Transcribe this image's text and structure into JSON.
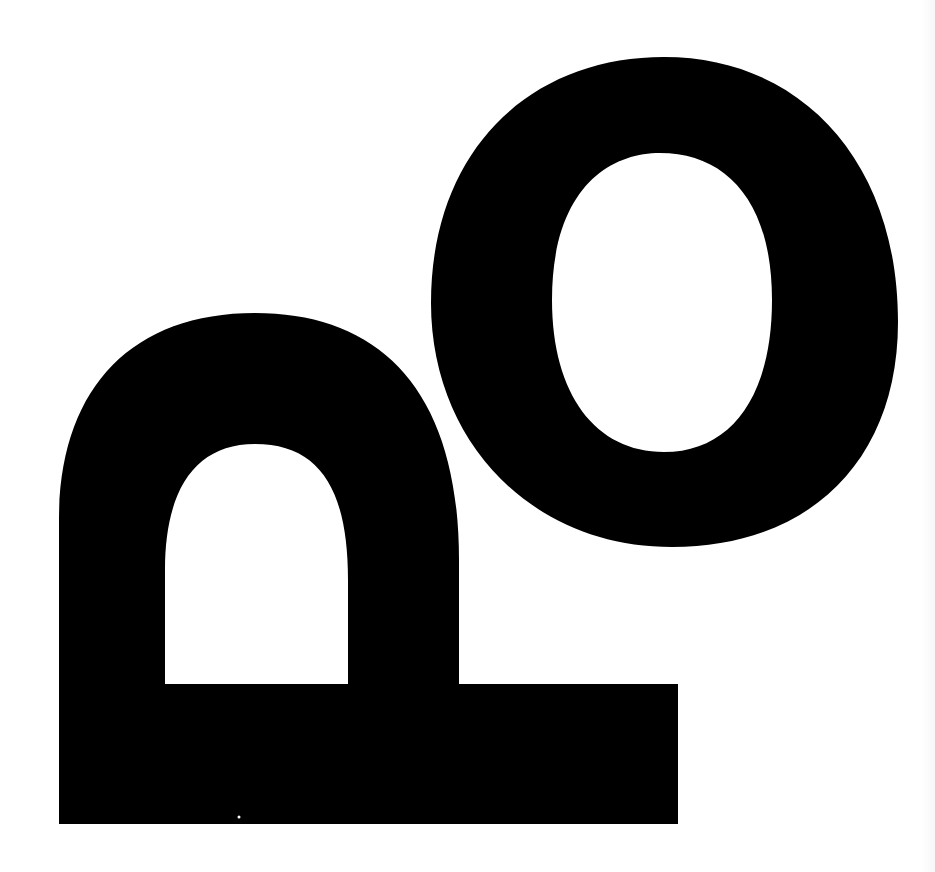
{
  "graphic": {
    "title": "pO",
    "description": "Bold black logo mark: an inverted P / arch-with-baseline shape at lower left and a large oval O at upper right",
    "colors": {
      "background": "#ffffff",
      "foreground": "#000000"
    },
    "shapes": [
      {
        "name": "arch-glyph",
        "kind": "inverted-p"
      },
      {
        "name": "o-glyph",
        "kind": "oval-ring"
      }
    ]
  }
}
